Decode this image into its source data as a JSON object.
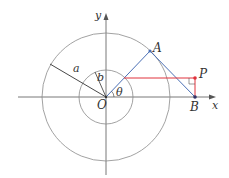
{
  "diagram": {
    "type": "geometry",
    "colors": {
      "axis": "#555555",
      "circle": "#8a8a8a",
      "radius_line": "#333333",
      "blue_line": "#4a6fb5",
      "red_line": "#e0323c",
      "point_dark": "#333366",
      "point_red": "#e0323c"
    },
    "labels": {
      "y_axis": "y",
      "x_axis": "x",
      "origin": "O",
      "point_A": "A",
      "point_B": "B",
      "point_P": "P",
      "radius_a": "a",
      "radius_b": "b",
      "angle": "θ"
    },
    "geometry": {
      "origin": [
        106,
        97
      ],
      "outer_radius": 64,
      "inner_radius": 27,
      "A": [
        150,
        51
      ],
      "B": [
        195,
        97
      ],
      "P": [
        195,
        78
      ],
      "inner_intersect": [
        124,
        78
      ]
    }
  }
}
